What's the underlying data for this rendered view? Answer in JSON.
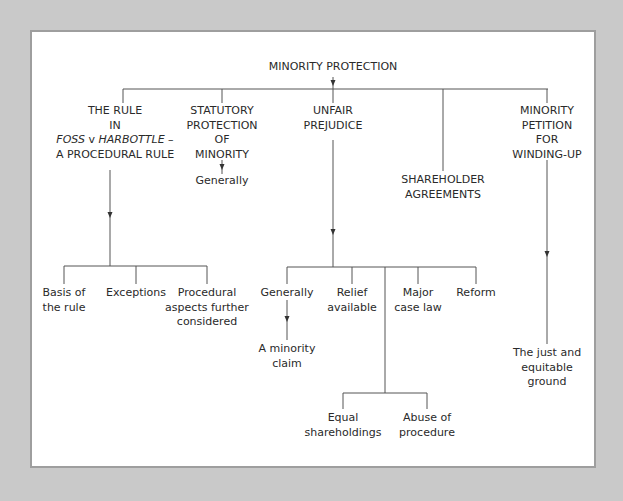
{
  "diagram": {
    "root": {
      "label": "MINORITY PROTECTION"
    },
    "branches": [
      {
        "id": "foss",
        "lines": [
          "THE RULE",
          "IN",
          "FOSS v HARBOTTLE –",
          "A PROCEDURAL RULE"
        ],
        "line3_parts": {
          "a": "FOSS",
          "b": " v ",
          "c": "HARBOTTLE",
          "d": " –"
        },
        "children": [
          {
            "lines": [
              "Basis of",
              "the rule"
            ]
          },
          {
            "lines": [
              "Exceptions"
            ]
          },
          {
            "lines": [
              "Procedural",
              "aspects further",
              "considered"
            ]
          }
        ]
      },
      {
        "id": "statutory",
        "lines": [
          "STATUTORY",
          "PROTECTION",
          "OF",
          "MINORITY"
        ],
        "children": [
          {
            "lines": [
              "Generally"
            ]
          }
        ]
      },
      {
        "id": "unfair",
        "lines": [
          "UNFAIR",
          "PREJUDICE"
        ],
        "children": [
          {
            "lines": [
              "Generally"
            ],
            "children": [
              {
                "lines": [
                  "A minority",
                  "claim"
                ]
              }
            ]
          },
          {
            "lines": [
              "Relief",
              "available"
            ]
          },
          {
            "lines": [
              "Major",
              "case law"
            ]
          },
          {
            "lines": [
              "Reform"
            ]
          }
        ],
        "sub_children": [
          {
            "lines": [
              "Equal",
              "shareholdings"
            ]
          },
          {
            "lines": [
              "Abuse of",
              "procedure"
            ]
          }
        ]
      },
      {
        "id": "shareholder",
        "lines": [
          "SHAREHOLDER",
          "AGREEMENTS"
        ]
      },
      {
        "id": "petition",
        "lines": [
          "MINORITY",
          "PETITION",
          "FOR",
          "WINDING-UP"
        ],
        "children": [
          {
            "lines": [
              "The just and",
              "equitable",
              "ground"
            ]
          }
        ]
      }
    ]
  },
  "colors": {
    "background": "#c9c9c9",
    "panel": "#ffffff",
    "panel_border": "#9e9e9e",
    "line": "#555555",
    "text": "#2a2a2a"
  }
}
